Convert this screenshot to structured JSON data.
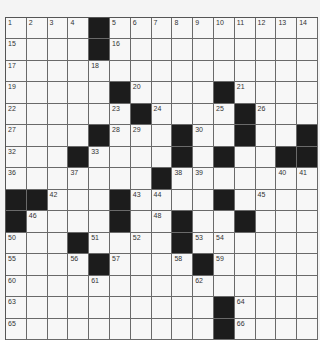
{
  "puzzle": {
    "rows": 15,
    "cols": 15,
    "grid": [
      ".... ..........",
      ".... ..........",
      "...............",
      "..... .... ....",
      "...... .... ...",
      ".... ... .. .. ",
      "... .... . ..  ",
      "....... .......",
      "  ... .... ....",
      " .... .. .. ...",
      "... .... ......",
      ".... .... .....",
      "...............",
      ".......... ....",
      ".......... ...."
    ],
    "numbers": [
      {
        "r": 0,
        "c": 0,
        "n": "1"
      },
      {
        "r": 0,
        "c": 1,
        "n": "2"
      },
      {
        "r": 0,
        "c": 2,
        "n": "3"
      },
      {
        "r": 0,
        "c": 3,
        "n": "4"
      },
      {
        "r": 0,
        "c": 5,
        "n": "5"
      },
      {
        "r": 0,
        "c": 6,
        "n": "6"
      },
      {
        "r": 0,
        "c": 7,
        "n": "7"
      },
      {
        "r": 0,
        "c": 8,
        "n": "8"
      },
      {
        "r": 0,
        "c": 9,
        "n": "9"
      },
      {
        "r": 0,
        "c": 10,
        "n": "10"
      },
      {
        "r": 0,
        "c": 11,
        "n": "11"
      },
      {
        "r": 0,
        "c": 12,
        "n": "12"
      },
      {
        "r": 0,
        "c": 13,
        "n": "13"
      },
      {
        "r": 0,
        "c": 14,
        "n": "14"
      },
      {
        "r": 1,
        "c": 0,
        "n": "15"
      },
      {
        "r": 1,
        "c": 5,
        "n": "16"
      },
      {
        "r": 2,
        "c": 0,
        "n": "17"
      },
      {
        "r": 2,
        "c": 4,
        "n": "18"
      },
      {
        "r": 3,
        "c": 0,
        "n": "19"
      },
      {
        "r": 3,
        "c": 6,
        "n": "20"
      },
      {
        "r": 3,
        "c": 11,
        "n": "21"
      },
      {
        "r": 4,
        "c": 0,
        "n": "22"
      },
      {
        "r": 4,
        "c": 5,
        "n": "23"
      },
      {
        "r": 4,
        "c": 7,
        "n": "24"
      },
      {
        "r": 4,
        "c": 10,
        "n": "25"
      },
      {
        "r": 4,
        "c": 12,
        "n": "26"
      },
      {
        "r": 5,
        "c": 0,
        "n": "27"
      },
      {
        "r": 5,
        "c": 5,
        "n": "28"
      },
      {
        "r": 5,
        "c": 6,
        "n": "29"
      },
      {
        "r": 5,
        "c": 9,
        "n": "30"
      },
      {
        "r": 5,
        "c": 11,
        "n": "31"
      },
      {
        "r": 6,
        "c": 0,
        "n": "32"
      },
      {
        "r": 6,
        "c": 4,
        "n": "33"
      },
      {
        "r": 6,
        "c": 8,
        "n": "34"
      },
      {
        "r": 6,
        "c": 10,
        "n": "35"
      },
      {
        "r": 7,
        "c": 0,
        "n": "36"
      },
      {
        "r": 7,
        "c": 3,
        "n": "37"
      },
      {
        "r": 7,
        "c": 8,
        "n": "38"
      },
      {
        "r": 7,
        "c": 9,
        "n": "39"
      },
      {
        "r": 7,
        "c": 13,
        "n": "40"
      },
      {
        "r": 7,
        "c": 14,
        "n": "41"
      },
      {
        "r": 8,
        "c": 2,
        "n": "42"
      },
      {
        "r": 8,
        "c": 6,
        "n": "43"
      },
      {
        "r": 8,
        "c": 7,
        "n": "44"
      },
      {
        "r": 8,
        "c": 12,
        "n": "45"
      },
      {
        "r": 9,
        "c": 1,
        "n": "46"
      },
      {
        "r": 9,
        "c": 5,
        "n": "47"
      },
      {
        "r": 9,
        "c": 7,
        "n": "48"
      },
      {
        "r": 9,
        "c": 11,
        "n": "49"
      },
      {
        "r": 10,
        "c": 0,
        "n": "50"
      },
      {
        "r": 10,
        "c": 4,
        "n": "51"
      },
      {
        "r": 10,
        "c": 6,
        "n": "52"
      },
      {
        "r": 10,
        "c": 9,
        "n": "53"
      },
      {
        "r": 10,
        "c": 10,
        "n": "54"
      },
      {
        "r": 11,
        "c": 0,
        "n": "55"
      },
      {
        "r": 11,
        "c": 3,
        "n": "56"
      },
      {
        "r": 11,
        "c": 5,
        "n": "57"
      },
      {
        "r": 11,
        "c": 8,
        "n": "58"
      },
      {
        "r": 11,
        "c": 10,
        "n": "59"
      },
      {
        "r": 12,
        "c": 0,
        "n": "60"
      },
      {
        "r": 12,
        "c": 4,
        "n": "61"
      },
      {
        "r": 12,
        "c": 9,
        "n": "62"
      },
      {
        "r": 13,
        "c": 0,
        "n": "63"
      },
      {
        "r": 13,
        "c": 11,
        "n": "64"
      },
      {
        "r": 14,
        "c": 0,
        "n": "65"
      },
      {
        "r": 14,
        "c": 11,
        "n": "66"
      }
    ]
  }
}
